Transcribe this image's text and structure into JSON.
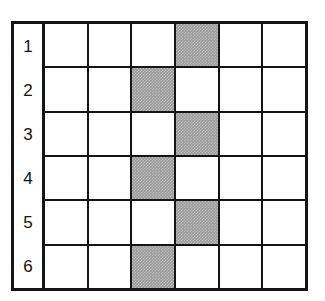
{
  "figure": {
    "type": "grid-diagram",
    "row_labels": [
      "1",
      "2",
      "3",
      "4",
      "5",
      "6"
    ],
    "columns": 6,
    "rows": 6,
    "colors": {
      "background": "#ffffff",
      "border": "#151515",
      "cell_fill": "#ffffff",
      "shaded_fill": "#9a9a9a"
    },
    "shaded_columns_by_row": [
      4,
      3,
      4,
      3,
      4,
      3
    ],
    "grid": [
      [
        "",
        "",
        "",
        "shaded",
        "",
        ""
      ],
      [
        "",
        "",
        "shaded",
        "",
        "",
        ""
      ],
      [
        "",
        "",
        "",
        "shaded",
        "",
        ""
      ],
      [
        "",
        "",
        "shaded",
        "",
        "",
        ""
      ],
      [
        "",
        "",
        "",
        "shaded",
        "",
        ""
      ],
      [
        "",
        "",
        "shaded",
        "",
        "",
        ""
      ]
    ]
  }
}
